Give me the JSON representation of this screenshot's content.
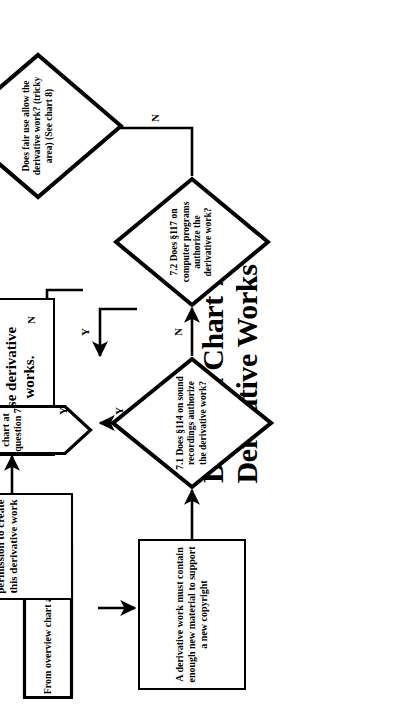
{
  "title": {
    "line1": "Decision Chart 7:",
    "line2": "Derivative Works"
  },
  "nodes": {
    "entry_tag": {
      "type": "connector-tag",
      "text": "From overview chart at question 7"
    },
    "note_box": {
      "type": "process",
      "text": "A derivative work must contain enough new material to support a new copyright"
    },
    "q71": {
      "type": "decision",
      "number": "7.1",
      "text": "7.1 Does §114 on sound recordings authorize the derivative work?"
    },
    "q72": {
      "type": "decision",
      "number": "7.2",
      "text": "7.2 Does §117 on computer programs authorize the derivative work?"
    },
    "no_permission_needed": {
      "type": "terminal",
      "text": "You do not need permission to create these derivative works."
    },
    "fair_use": {
      "type": "decision",
      "text": "Does fair use allow the derivative work? (tricky area) (See chart 8)"
    },
    "permission_needed": {
      "type": "terminal",
      "text": "You need permission to create this derivative work"
    },
    "return_tag": {
      "type": "connector-tag",
      "text": "Return to overview chart at question 7"
    }
  },
  "edges": [
    {
      "id": "entry-to-note",
      "label": ""
    },
    {
      "id": "note-to-q71",
      "label": ""
    },
    {
      "id": "q71-yes-up",
      "label": "Y"
    },
    {
      "id": "q71-no-right",
      "label": "N"
    },
    {
      "id": "q72-yes-left",
      "label": "Y"
    },
    {
      "id": "q72-no-right",
      "label": "N"
    },
    {
      "id": "nopermission-to-fairuse",
      "label": "Y"
    },
    {
      "id": "fairuse-no-to-permission",
      "label": "N"
    },
    {
      "id": "permission-to-return",
      "label": ""
    }
  ],
  "colors": {
    "ink": "#000000",
    "paper": "#ffffff"
  }
}
